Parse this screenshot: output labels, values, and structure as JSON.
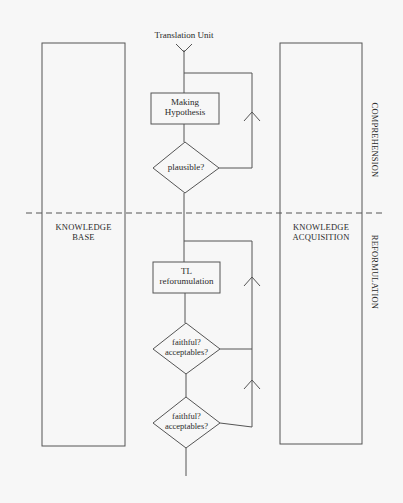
{
  "diagram": {
    "input_label": "Translation Unit",
    "nodes": {
      "making_hypothesis": {
        "line1": "Making",
        "line2": "Hypothesis"
      },
      "plausible": {
        "label": "plausible?"
      },
      "tl_reformulation": {
        "line1": "TL",
        "line2": "reforumulation"
      },
      "faithful_1": {
        "line1": "faithful?",
        "line2": "acceptables?"
      },
      "faithful_2": {
        "line1": "faithful?",
        "line2": "acceptables?"
      }
    },
    "side_boxes": {
      "knowledge_base": {
        "line1": "KNOWLEDGE",
        "line2": "BASE"
      },
      "knowledge_acquisition": {
        "line1": "KNOWLEDGE",
        "line2": "ACQUISITION"
      }
    },
    "phases": {
      "comprehension": "COMPREHENSION",
      "reformulation": "REFORMULATION"
    },
    "colors": {
      "background": "#f7f7f7",
      "stroke": "#555555",
      "text": "#2a2a2a"
    }
  }
}
